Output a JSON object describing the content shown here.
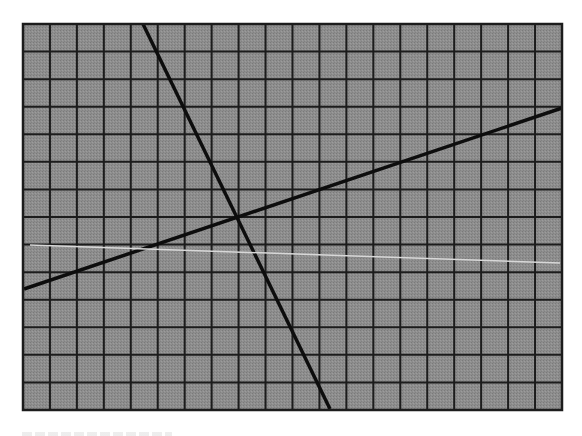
{
  "figure": {
    "type": "graph-paper-line-diagram",
    "canvas": {
      "width": 582,
      "height": 436,
      "background": "#ffffff"
    },
    "grid": {
      "left": 23,
      "top": 24,
      "right": 562,
      "bottom": 410,
      "columns": 20,
      "rows": 14,
      "fill_color": "#8c8c8c",
      "line_color": "#1c1c1c",
      "line_width": 2,
      "frame_width": 2.5
    },
    "lines": [
      {
        "name": "steep-line",
        "description": "Steep dark line descending left to right",
        "x1": 143,
        "y1": 24,
        "x2": 330,
        "y2": 409,
        "color": "#0d0d0d",
        "width": 3.5
      },
      {
        "name": "shallow-line",
        "description": "Shallow dark line ascending left to right",
        "x1": 24,
        "y1": 289,
        "x2": 562,
        "y2": 108,
        "color": "#0d0d0d",
        "width": 3.5
      },
      {
        "name": "light-line",
        "description": "Faint light nearly-horizontal line",
        "x1": 30,
        "y1": 245,
        "x2": 560,
        "y2": 263,
        "color": "#d8d8d8",
        "width": 1.5
      }
    ],
    "intersection": {
      "x": 238,
      "y": 218
    }
  }
}
